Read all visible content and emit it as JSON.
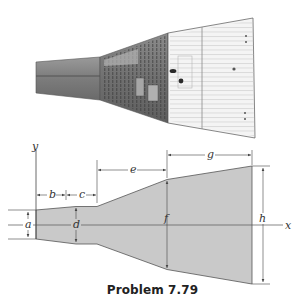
{
  "caption": "Problem 7.79",
  "photo": {
    "subject": "spacecraft-side-view",
    "colors": {
      "dark_section": "#8a8a8a",
      "light_section": "#f2f2f2",
      "outline": "#555555"
    }
  },
  "diagram": {
    "axes": {
      "x_label": "x",
      "y_label": "y"
    },
    "dimensions": {
      "a": "a",
      "b": "b",
      "c": "c",
      "d": "d",
      "e": "e",
      "f": "f",
      "g": "g",
      "h": "h"
    },
    "colors": {
      "fill": "#c8c8c8",
      "stroke": "#555555",
      "dim_line": "#444444"
    }
  }
}
